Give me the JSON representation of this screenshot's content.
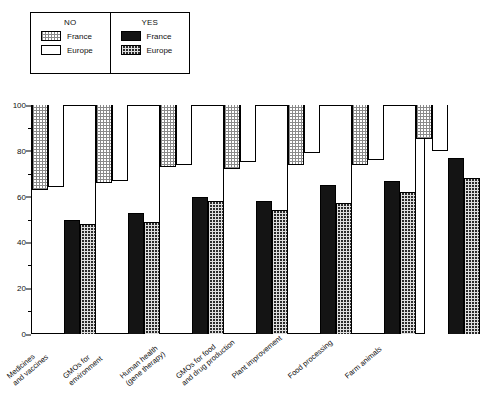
{
  "legend": {
    "columns": [
      {
        "title": "NO",
        "entries": [
          {
            "label": "France",
            "swatch": "light-dotted-pattern"
          },
          {
            "label": "Europe",
            "swatch": "white-empty"
          }
        ]
      },
      {
        "title": "YES",
        "entries": [
          {
            "label": "France",
            "swatch": "solid-black"
          },
          {
            "label": "Europe",
            "swatch": "dark-checkered-pattern"
          }
        ]
      }
    ]
  },
  "chart_data": {
    "type": "bar",
    "title": "",
    "xlabel": "",
    "ylabel": "",
    "ylim": [
      0,
      100
    ],
    "yticks": [
      0,
      20,
      40,
      60,
      80,
      100
    ],
    "ytick_labels": [
      "0",
      "20",
      "40",
      "60",
      "80",
      "100"
    ],
    "minor_tick_step": 10,
    "grid": false,
    "legend_position": "top-left",
    "orientation": "vertical",
    "note": "NO series are drawn hanging down from 100; YES series rise from 0",
    "categories": [
      "Medicines\nand vaccines",
      "GMOs for\nenvironment",
      "Human health\n(gene therapy)",
      "GMOs for food\nand drug production",
      "Plant improvement",
      "Food processing",
      "Farm animals"
    ],
    "category_labels": [
      [
        "Medicines",
        "and vaccines"
      ],
      [
        "GMOs for",
        "environment"
      ],
      [
        "Human health",
        "(gene therapy)"
      ],
      [
        "GMOs for food",
        "and drug production"
      ],
      [
        "Plant improvement"
      ],
      [
        "Food processing"
      ],
      [
        "Farm animals"
      ]
    ],
    "series": [
      {
        "name": "NO France",
        "anchor": "top",
        "values": [
          37,
          34,
          27,
          28,
          26,
          26,
          15
        ]
      },
      {
        "name": "NO Europe",
        "anchor": "top",
        "values": [
          36,
          33,
          26,
          25,
          21,
          24,
          20
        ]
      },
      {
        "name": "YES France",
        "anchor": "bottom",
        "values": [
          50,
          53,
          60,
          58,
          65,
          67,
          77
        ]
      },
      {
        "name": "YES Europe",
        "anchor": "bottom",
        "values": [
          48,
          49,
          58,
          54,
          57,
          62,
          68
        ]
      }
    ],
    "no_bar_end_values": {
      "NO France": [
        63,
        66,
        73,
        72,
        74,
        74,
        85
      ],
      "NO Europe": [
        64,
        67,
        74,
        75,
        79,
        76,
        80
      ]
    }
  }
}
